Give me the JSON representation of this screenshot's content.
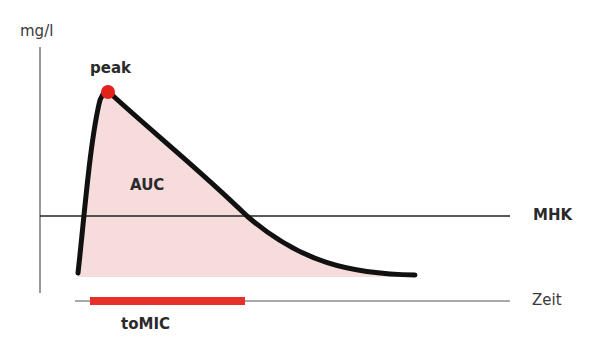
{
  "diagram": {
    "y_axis_label": "mg/l",
    "x_axis_label": "Zeit",
    "peak_label": "peak",
    "area_label": "AUC",
    "threshold_label": "MHK",
    "duration_label": "toMIC",
    "colors": {
      "curve": "#111111",
      "fill": "#f7d9d9",
      "peak_marker": "#e2231a",
      "duration_bar": "#e8302a",
      "axis": "#444444"
    }
  }
}
